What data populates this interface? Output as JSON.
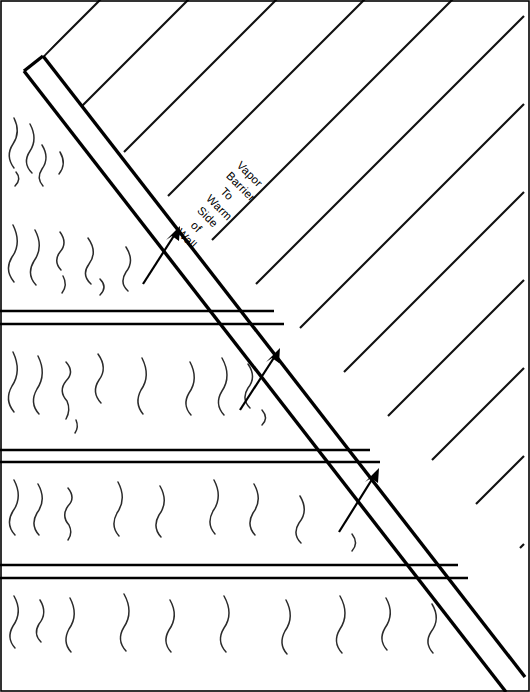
{
  "diagram": {
    "title": "Vapor Barrier To Warm Side of Wall",
    "type": "architectural-wall-section",
    "width": 530,
    "height": 692,
    "background_color": "#ffffff",
    "line_color": "#000000",
    "squiggle_color": "#2b2b2b"
  },
  "callout": {
    "lines": [
      "Vapor",
      "Barrier",
      "To",
      "Warm",
      "Side",
      "of",
      "Wall"
    ],
    "full_text": "Vapor Barrier To Warm Side of Wall",
    "rotation_degrees": 45,
    "anchor_x": 236,
    "anchor_y": 166
  },
  "regions": {
    "left": {
      "name": "insulation-cavity",
      "description": "Insulation batting shown with wavy squiggle marks, divided into horizontal bands"
    },
    "right": {
      "name": "framing-hatch",
      "description": "Framing member shown with 45 degree parallel hatch lines"
    }
  },
  "barrier": {
    "name": "vapor-barrier",
    "description": "Double-line diagonal band running from upper-left to lower-right",
    "outer": {
      "x1": 24,
      "y1": 71,
      "x2": 506,
      "y2": 692
    },
    "inner": {
      "x1": 43,
      "y1": 56,
      "x2": 525,
      "y2": 677
    },
    "cap": {
      "x1": 24,
      "y1": 71,
      "x2": 43,
      "y2": 56
    }
  },
  "arrows": [
    {
      "name": "flow-arrow-upper",
      "x1": 143,
      "y1": 284,
      "x2": 180,
      "y2": 226
    },
    {
      "name": "flow-arrow-middle",
      "x1": 240,
      "y1": 410,
      "x2": 280,
      "y2": 348
    },
    {
      "name": "flow-arrow-lower",
      "x1": 339,
      "y1": 532,
      "x2": 379,
      "y2": 468
    }
  ],
  "band_separators": [
    {
      "y_top": 311,
      "y_bottom": 324
    },
    {
      "y_top": 450,
      "y_bottom": 462
    },
    {
      "y_top": 565,
      "y_bottom": 578
    }
  ],
  "hatch": {
    "angle_degrees": 45,
    "spacing_px": 62,
    "direction": "up-right"
  }
}
